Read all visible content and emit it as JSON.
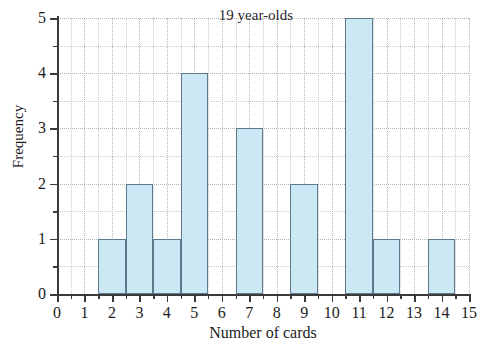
{
  "chart_data": {
    "type": "bar",
    "title": "19 year-olds",
    "xlabel": "Number of cards",
    "ylabel": "Frequency",
    "categories": [
      0,
      1,
      2,
      3,
      4,
      5,
      6,
      7,
      8,
      9,
      10,
      11,
      12,
      13,
      14,
      15
    ],
    "values": [
      0,
      0,
      1,
      2,
      1,
      4,
      0,
      3,
      0,
      2,
      0,
      5,
      1,
      0,
      1,
      0
    ],
    "xlim": [
      0,
      15
    ],
    "ylim": [
      0,
      5
    ],
    "x_tick_labels": [
      "0",
      "1",
      "2",
      "3",
      "4",
      "5",
      "6",
      "7",
      "8",
      "9",
      "10",
      "11",
      "12",
      "13",
      "14",
      "15"
    ],
    "y_tick_labels": [
      "0",
      "1",
      "2",
      "3",
      "4",
      "5"
    ],
    "y_minor_ticks": [
      0.5,
      1.5,
      2.5,
      3.5,
      4.5
    ],
    "x_minor_ticks": [
      0.5,
      1.5,
      2.5,
      3.5,
      4.5,
      5.5,
      6.5,
      7.5,
      8.5,
      9.5,
      10.5,
      11.5,
      12.5,
      13.5,
      14.5
    ],
    "bar_width": 1,
    "grid": true,
    "grid_style": "dotted",
    "legend": null,
    "bar_fill_color": "#cce8f4",
    "bar_edge_color": "#5d7a8c",
    "grid_color": "#b3b3b3",
    "axis_color": "#3a3a3a",
    "background_color": "#ffffff"
  }
}
